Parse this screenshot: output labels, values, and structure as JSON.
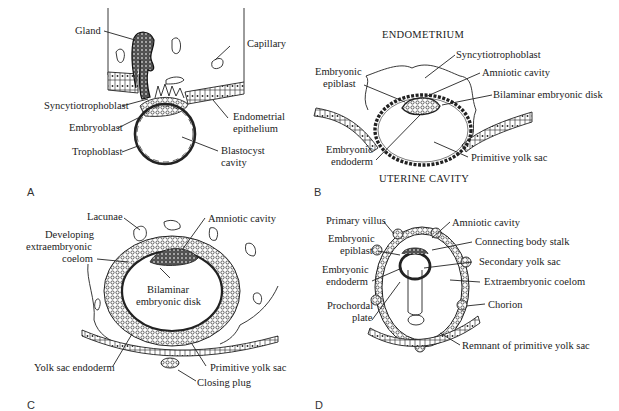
{
  "figure": {
    "panels": [
      {
        "id": "A",
        "letter": "A",
        "labels": {
          "gland": "Gland",
          "capillary": "Capillary",
          "syncytiotrophoblast": "Syncytiotrophoblast",
          "endometrial_epithelium_1": "Endometrial",
          "endometrial_epithelium_2": "epithelium",
          "embryoblast": "Embryoblast",
          "trophoblast": "Trophoblast",
          "blastocyst_cavity_1": "Blastocyst",
          "blastocyst_cavity_2": "cavity"
        }
      },
      {
        "id": "B",
        "letter": "B",
        "labels": {
          "endometrium": "ENDOMETRIUM",
          "syncytiotrophoblast": "Syncytiotrophoblast",
          "embryonic_epiblast_1": "Embryonic",
          "embryonic_epiblast_2": "epiblast",
          "amniotic_cavity": "Amniotic cavity",
          "bilaminar_embryonic_disk": "Bilaminar embryonic disk",
          "embryonic_endoderm_1": "Embryonic",
          "embryonic_endoderm_2": "endoderm",
          "primitive_yolk_sac": "Primitive yolk sac",
          "uterine_cavity": "UTERINE CAVITY"
        }
      },
      {
        "id": "C",
        "letter": "C",
        "labels": {
          "lacunae": "Lacunae",
          "amniotic_cavity": "Amniotic cavity",
          "developing_1": "Developing",
          "developing_2": "extraembryonic",
          "developing_3": "coelom",
          "bilaminar_1": "Bilaminar",
          "bilaminar_2": "embryonic disk",
          "yolk_sac_endoderm": "Yolk sac endoderm",
          "primitive_yolk_sac": "Primitive yolk sac",
          "closing_plug": "Closing plug"
        }
      },
      {
        "id": "D",
        "letter": "D",
        "labels": {
          "primary_villus": "Primary villus",
          "amniotic_cavity": "Amniotic cavity",
          "embryonic_epiblast_1": "Embryonic",
          "embryonic_epiblast_2": "epiblast",
          "connecting_body_stalk": "Connecting body stalk",
          "secondary_yolk_sac": "Secondary yolk sac",
          "embryonic_endoderm_1": "Embryonic",
          "embryonic_endoderm_2": "endoderm",
          "extraembryonic_coelom": "Extraembryonic coelom",
          "prochordal_plate_1": "Prochordal",
          "prochordal_plate_2": "plate",
          "chorion": "Chorion",
          "remnant": "Remnant of primitive yolk sac"
        }
      }
    ]
  }
}
